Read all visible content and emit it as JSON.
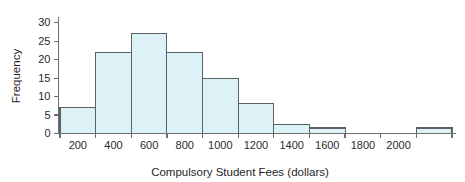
{
  "chart_data": {
    "type": "bar",
    "title": "",
    "subtitle": "",
    "xlabel": "Compulsory Student Fees (dollars)",
    "ylabel": "Frequency",
    "grid": false,
    "legend": null,
    "xlim": [
      100,
      2300
    ],
    "ylim": [
      0,
      31
    ],
    "bin_width": 200,
    "x_ticks": [
      200,
      400,
      600,
      800,
      1000,
      1200,
      1400,
      1600,
      1800,
      2000
    ],
    "x_tick_labels": [
      "200",
      "400",
      "600",
      "800",
      "1000",
      "1200",
      "1400",
      "1600",
      "1800",
      "2000"
    ],
    "y_ticks": [
      0,
      5,
      10,
      15,
      20,
      25,
      30
    ],
    "y_tick_labels": [
      "0",
      "5",
      "10",
      "15",
      "20",
      "25",
      "30"
    ],
    "bins": [
      {
        "start": 100,
        "end": 300,
        "value": 7
      },
      {
        "start": 300,
        "end": 500,
        "value": 22
      },
      {
        "start": 500,
        "end": 700,
        "value": 27
      },
      {
        "start": 700,
        "end": 900,
        "value": 22
      },
      {
        "start": 900,
        "end": 1100,
        "value": 15
      },
      {
        "start": 1100,
        "end": 1300,
        "value": 8
      },
      {
        "start": 1300,
        "end": 1500,
        "value": 2.5
      },
      {
        "start": 1500,
        "end": 1700,
        "value": 1.5
      },
      {
        "start": 1700,
        "end": 1900,
        "value": 0
      },
      {
        "start": 1900,
        "end": 2100,
        "value": 0
      },
      {
        "start": 2100,
        "end": 2300,
        "value": 1.5
      }
    ],
    "categories": [
      "100-300",
      "300-500",
      "500-700",
      "700-900",
      "900-1100",
      "1100-1300",
      "1300-1500",
      "1500-1700",
      "1700-1900",
      "1900-2100",
      "2100-2300"
    ],
    "values": [
      7,
      22,
      27,
      22,
      15,
      8,
      2.5,
      1.5,
      0,
      0,
      1.5
    ],
    "colors": {
      "bar_fill": "#ddf2f7",
      "bar_stroke": "#5d6163",
      "axis": "#6d6f70",
      "text": "#1f1f1f",
      "background": "#ffffff"
    }
  }
}
